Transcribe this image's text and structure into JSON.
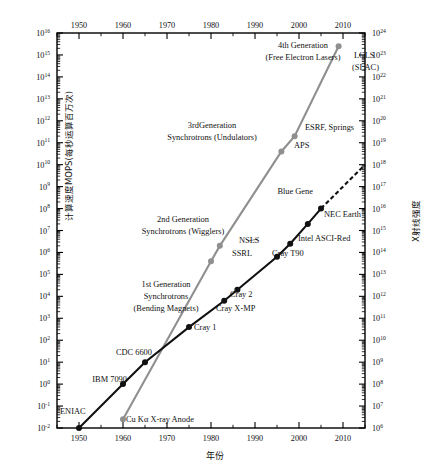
{
  "axes": {
    "x_label": "年份",
    "y_left_label": "计算速度MOPS(每秒运算百万次)",
    "y_right_label": "X射线强度",
    "x_ticks": [
      "1950",
      "1960",
      "1970",
      "1980",
      "1990",
      "2000",
      "2010"
    ],
    "y_left_ticks": [
      "10-2",
      "10-1",
      "100",
      "101",
      "102",
      "103",
      "104",
      "105",
      "106",
      "107",
      "108",
      "109",
      "1010",
      "1011",
      "1012",
      "1013",
      "1014",
      "1015",
      "1016"
    ],
    "y_right_ticks": [
      "106",
      "107",
      "108",
      "109",
      "1010",
      "1011",
      "1012",
      "1013",
      "1014",
      "1015",
      "1016",
      "1017",
      "1018",
      "1019",
      "1020",
      "1021",
      "1022",
      "1023",
      "1024"
    ]
  },
  "colors": {
    "computer_line": "#111111",
    "xray_line": "#8f8f8f",
    "axis": "#000000",
    "background": "#ffffff"
  },
  "chart_data": {
    "type": "line",
    "title": "",
    "xlabel": "年份",
    "ylabel": "计算速度MOPS(每秒运算百万次)",
    "y2label": "X射线强度",
    "xlim": [
      1945,
      2015
    ],
    "ylim_left_log10": [
      -2,
      16
    ],
    "ylim_right_log10": [
      6,
      24
    ],
    "grid": false,
    "legend": "none",
    "xscale": "linear",
    "yscale": "log",
    "series": [
      {
        "name": "Computing speed (MOPS)",
        "color": "#111111",
        "style": "solid-then-dashed",
        "axis": "left",
        "points": [
          {
            "label": "ENIAC",
            "year": 1950,
            "log10_mops": -2.0
          },
          {
            "label": "IBM 7090",
            "year": 1960,
            "log10_mops": 0.0
          },
          {
            "label": "CDC 6600",
            "year": 1965,
            "log10_mops": 1.0
          },
          {
            "label": "Cray 1",
            "year": 1975,
            "log10_mops": 2.6
          },
          {
            "label": "Cray X-MP",
            "year": 1983,
            "log10_mops": 3.8
          },
          {
            "label": "Cray 2",
            "year": 1986,
            "log10_mops": 4.3
          },
          {
            "label": "Cray T90",
            "year": 1995,
            "log10_mops": 5.8
          },
          {
            "label": "Intel ASCI-Red",
            "year": 1998,
            "log10_mops": 6.4
          },
          {
            "label": "NEC Earth",
            "year": 2002,
            "log10_mops": 7.3
          },
          {
            "label": "Blue Gene",
            "year": 2005,
            "log10_mops": 8.0
          }
        ],
        "extrapolation": {
          "from_year": 2005,
          "to_year": 2015,
          "to_log10_mops": 10.0,
          "style": "dashed"
        }
      },
      {
        "name": "X-ray source brilliance",
        "color": "#8f8f8f",
        "style": "solid",
        "axis": "right",
        "points": [
          {
            "label": "Cu Kα X-ray Anode",
            "year": 1960,
            "log10_brilliance": 6.4
          },
          {
            "label": "SSRL",
            "year": 1980,
            "log10_brilliance": 13.6
          },
          {
            "label": "NSLS",
            "year": 1982,
            "log10_brilliance": 14.3
          },
          {
            "label": "APS",
            "year": 1996,
            "log10_brilliance": 18.6
          },
          {
            "label": "ESRF, Springs",
            "year": 1999,
            "log10_brilliance": 19.3
          },
          {
            "label": "LCLS (SLAC)",
            "year": 2009,
            "log10_brilliance": 23.4
          }
        ]
      }
    ],
    "annotations": [
      {
        "text": "4th Generation",
        "year": 2001,
        "where": "upper-right"
      },
      {
        "text": "(Free Electron Lasers)",
        "year": 2001,
        "where": "upper-right"
      },
      {
        "text": "3rdGeneration",
        "year": 1986,
        "where": "middle"
      },
      {
        "text": "Synchrotrons (Undulators)",
        "year": 1986,
        "where": "middle"
      },
      {
        "text": "2nd Generation",
        "year": 1974,
        "where": "middle"
      },
      {
        "text": "Synchrotrons (Wigglers)",
        "year": 1974,
        "where": "middle"
      },
      {
        "text": "1st Generation",
        "year": 1969,
        "where": "lower"
      },
      {
        "text": "Synchrotrons",
        "year": 1969,
        "where": "lower"
      },
      {
        "text": "(Bending Magnets)",
        "year": 1969,
        "where": "lower"
      }
    ]
  },
  "labels": {
    "gen4_l1": "4th Generation",
    "gen4_l2": "(Free Electron Lasers)",
    "lcls_l1": "LCLS",
    "lcls_l2": "(SLAC)",
    "gen3_l1": "3rdGeneration",
    "gen3_l2": "Synchrotrons (Undulators)",
    "esrf": "ESRF, Springs",
    "aps": "APS",
    "gen2_l1": "2nd Generation",
    "gen2_l2": "Synchrotrons (Wigglers)",
    "nsls": "NSLS",
    "ssrl": "SSRL",
    "gen1_l1": "1st Generation",
    "gen1_l2": "Synchrotrons",
    "gen1_l3": "(Bending Magnets)",
    "blue_gene": "Blue Gene",
    "nec_earth": "NEC Earth",
    "intel_asci": "Intel ASCI-Red",
    "cray_t90": "Cray T90",
    "cray2": "Cray 2",
    "crayxmp": "Cray X-MP",
    "cray1": "Cray 1",
    "cdc6600": "CDC 6600",
    "ibm7090": "IBM 7090",
    "eniac": "ENIAC",
    "cuka": "Cu Kα X-ray Anode"
  }
}
